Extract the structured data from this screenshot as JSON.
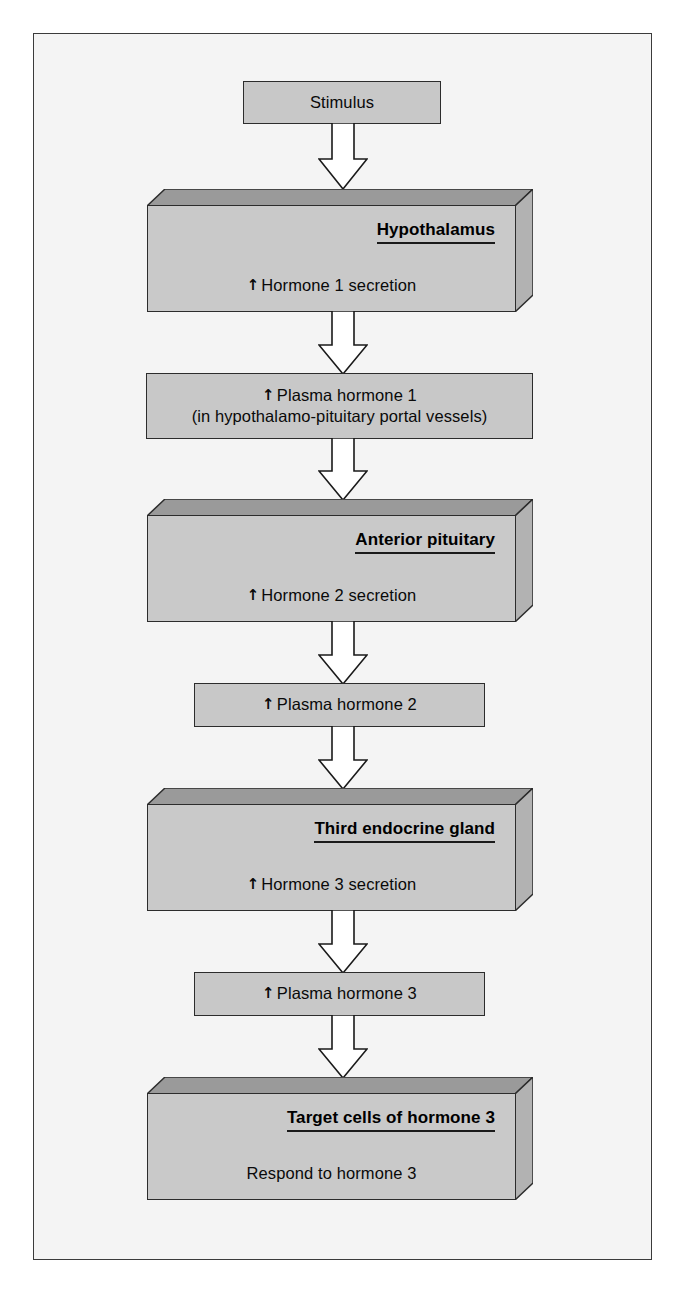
{
  "figure": {
    "background_color": "#f4f4f4",
    "border_color": "#3b3b3b",
    "box_fill": "#c9c9c9",
    "box_top_face": "#9a9a9a",
    "box_side_face": "#b0b0b0",
    "outline_color": "#2c2c2c",
    "arrow_fill": "#ffffff",
    "arrow_outline": "#1a1a1a",
    "up_arrow_glyph": "↑"
  },
  "nodes": [
    {
      "id": "stimulus",
      "style": "flat",
      "lines": [
        "Stimulus"
      ]
    },
    {
      "id": "hypothalamus",
      "style": "slab",
      "title": "Hypothalamus",
      "body_prefix": "↑",
      "body": "Hormone 1 secretion"
    },
    {
      "id": "plasma-hormone-1",
      "style": "flat",
      "lines": [
        "↑ Plasma hormone 1",
        "(in hypothalamo-pituitary portal vessels)"
      ]
    },
    {
      "id": "anterior-pituitary",
      "style": "slab",
      "title": "Anterior pituitary",
      "body_prefix": "↑",
      "body": "Hormone 2 secretion"
    },
    {
      "id": "plasma-hormone-2",
      "style": "flat",
      "lines": [
        "↑ Plasma hormone 2"
      ]
    },
    {
      "id": "third-endocrine-gland",
      "style": "slab",
      "title": "Third endocrine gland",
      "body_prefix": "↑",
      "body": "Hormone 3 secretion"
    },
    {
      "id": "plasma-hormone-3",
      "style": "flat",
      "lines": [
        "↑ Plasma hormone 3"
      ]
    },
    {
      "id": "target-cells",
      "style": "slab",
      "title": "Target cells of hormone 3",
      "body_prefix": "",
      "body": "Respond to hormone 3"
    }
  ],
  "labels": {
    "stimulus": "Stimulus",
    "hypothalamus_title": "Hypothalamus",
    "hypothalamus_body": "Hormone 1 secretion",
    "plasma1_line1": "↑ Plasma hormone 1",
    "plasma1_line2": "(in hypothalamo-pituitary portal vessels)",
    "anterior_title": "Anterior pituitary",
    "anterior_body": "Hormone 2 secretion",
    "plasma2_line1": "↑ Plasma hormone 2",
    "third_title": "Third endocrine gland",
    "third_body": "Hormone 3 secretion",
    "plasma3_line1": "↑ Plasma hormone 3",
    "target_title": "Target cells of hormone 3",
    "target_body": "Respond to hormone 3",
    "up_arrow": "↑"
  },
  "flow_arrows": [
    {
      "id": "arrow-stimulus-to-hypothalamus",
      "from": "stimulus",
      "to": "hypothalamus"
    },
    {
      "id": "arrow-hypothalamus-to-plasma1",
      "from": "hypothalamus",
      "to": "plasma-hormone-1"
    },
    {
      "id": "arrow-plasma1-to-anterior",
      "from": "plasma-hormone-1",
      "to": "anterior-pituitary"
    },
    {
      "id": "arrow-anterior-to-plasma2",
      "from": "anterior-pituitary",
      "to": "plasma-hormone-2"
    },
    {
      "id": "arrow-plasma2-to-third",
      "from": "plasma-hormone-2",
      "to": "third-endocrine-gland"
    },
    {
      "id": "arrow-third-to-plasma3",
      "from": "third-endocrine-gland",
      "to": "plasma-hormone-3"
    },
    {
      "id": "arrow-plasma3-to-target",
      "from": "plasma-hormone-3",
      "to": "target-cells"
    }
  ]
}
